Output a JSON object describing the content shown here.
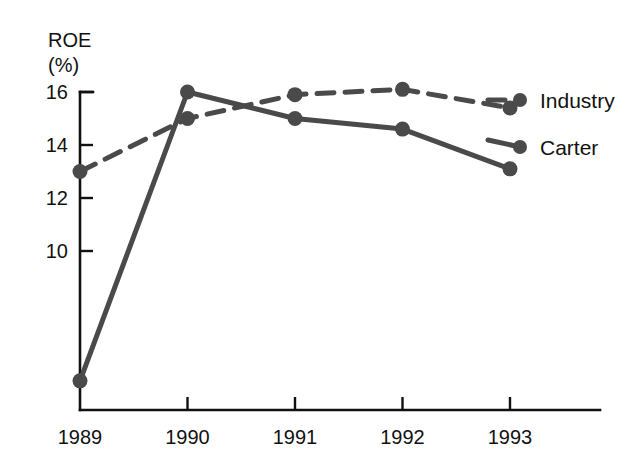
{
  "chart_data": {
    "type": "line",
    "title": "",
    "subtitle": "",
    "xlabel": "",
    "ylabel": "ROE\n(%)",
    "ylabel_line1": "ROE",
    "ylabel_line2": "(%)",
    "categories": [
      "1989",
      "1990",
      "1991",
      "1992",
      "1993"
    ],
    "x": [
      1989,
      1990,
      1991,
      1992,
      1993
    ],
    "yticks": [
      10,
      12,
      14,
      16
    ],
    "ytick_labels": [
      "10",
      "12",
      "14",
      "16"
    ],
    "ylim": [
      4,
      16.8
    ],
    "xlim": [
      1988.75,
      1993.35
    ],
    "grid": false,
    "legend_position": "right-inline",
    "series": [
      {
        "name": "Industry",
        "style": "dashed",
        "color": "#4a4a4a",
        "marker": "circle",
        "values": [
          13.0,
          15.0,
          15.9,
          16.1,
          15.4
        ]
      },
      {
        "name": "Carter",
        "style": "solid",
        "color": "#4a4a4a",
        "marker": "circle",
        "values": [
          5.1,
          16.0,
          15.0,
          14.6,
          13.1
        ]
      }
    ],
    "annotations": []
  },
  "colors": {
    "background": "#ffffff",
    "axis": "#111111",
    "series_gray": "#4a4a4a",
    "text": "#111111"
  },
  "legend": {
    "industry_label": "Industry",
    "carter_label": "Carter"
  }
}
